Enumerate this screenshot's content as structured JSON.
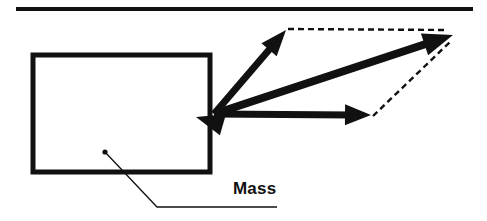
{
  "figure": {
    "width": 487,
    "height": 221,
    "background_color": "#ffffff",
    "stroke_color": "#111111",
    "labels": [
      {
        "id": "mass",
        "text": "Mass",
        "x": 233,
        "y": 180,
        "bold": true,
        "font_size": 17
      }
    ],
    "surface_line": {
      "name": "ceiling-line",
      "x1": 16,
      "y1": 9,
      "x2": 473,
      "y2": 9,
      "thickness": 4
    },
    "mass_box": {
      "name": "mass-rectangle",
      "x": 33,
      "y": 55,
      "width": 177,
      "height": 117,
      "thickness": 5
    },
    "leader": {
      "name": "mass-leader-line",
      "dot_x": 105,
      "dot_y": 152,
      "dot_radius": 2.6,
      "elbow_x": 157,
      "elbow_y": 207,
      "end_x": 277,
      "end_y": 207,
      "thickness": 1.3
    },
    "origin": {
      "x": 214,
      "y": 114
    },
    "vectors": [
      {
        "id": "vector-up-right",
        "name": "component-vector-upper",
        "label": "",
        "style": "solid",
        "x1": 214,
        "y1": 114,
        "x2": 286,
        "y2": 30,
        "thickness": 7,
        "head_length": 26,
        "head_width": 20
      },
      {
        "id": "vector-resultant",
        "name": "resultant-vector",
        "label": "",
        "style": "solid",
        "x1": 214,
        "y1": 114,
        "x2": 453,
        "y2": 35,
        "thickness": 8,
        "head_length": 30,
        "head_width": 23
      },
      {
        "id": "vector-horizontal",
        "name": "component-vector-horizontal",
        "label": "",
        "style": "solid",
        "x1": 214,
        "y1": 114,
        "x2": 371,
        "y2": 115,
        "thickness": 7,
        "head_length": 26,
        "head_width": 21
      },
      {
        "id": "vector-reverse-head",
        "name": "reaction-arrowhead-left",
        "label": "",
        "style": "arrowhead-only",
        "tip_x": 196,
        "tip_y": 117,
        "head_length": 28,
        "head_width": 22,
        "angle_deg": 196
      }
    ],
    "dashed_lines": [
      {
        "id": "dash-top",
        "name": "parallelogram-dashed-top",
        "x1": 288,
        "y1": 29,
        "x2": 447,
        "y2": 30,
        "thickness": 2.4,
        "dash": "6,4"
      },
      {
        "id": "dash-right",
        "name": "parallelogram-dashed-right",
        "x1": 373,
        "y1": 116,
        "x2": 450,
        "y2": 42,
        "thickness": 2.4,
        "dash": "6,4"
      }
    ]
  }
}
